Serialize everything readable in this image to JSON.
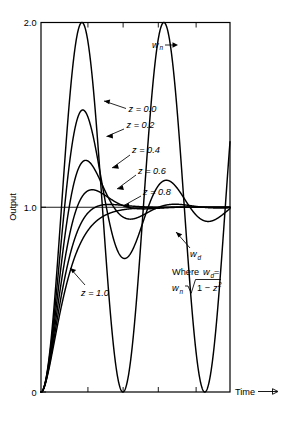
{
  "chart_data": {
    "type": "line",
    "title": "",
    "xlabel": "Time",
    "ylabel": "Output",
    "xlim": [
      0,
      14.5
    ],
    "ylim": [
      0,
      2.0
    ],
    "grid": false,
    "legend_position": "inline-annotations",
    "y_ticks": [
      "2.0",
      "1.0",
      "0"
    ],
    "y_tick_values": [
      2.0,
      1.0,
      0
    ],
    "x_ticks": [
      "",
      "",
      "",
      ""
    ],
    "x_tick_values": [
      3.6,
      6.3,
      9.0,
      11.9
    ],
    "series": [
      {
        "name": "z = 0.0",
        "zeta": 0.0,
        "label": "z = 0.0",
        "peak": 2.0
      },
      {
        "name": "z = 0.2",
        "zeta": 0.2,
        "label": "z = 0.2",
        "peak": 1.53
      },
      {
        "name": "z = 0.4",
        "zeta": 0.4,
        "label": "z = 0.4",
        "peak": 1.25
      },
      {
        "name": "z = 0.6",
        "zeta": 0.6,
        "label": "z = 0.6",
        "peak": 1.1
      },
      {
        "name": "z = 0.8",
        "zeta": 0.8,
        "label": "z = 0.8",
        "peak": 1.02
      },
      {
        "name": "z = 1.0",
        "zeta": 1.0,
        "label": "z = 1.0",
        "peak": 1.0
      }
    ],
    "annotations": [
      {
        "id": "wn",
        "text": "w",
        "sub": "n",
        "kind": "symbol-arrow"
      },
      {
        "id": "wd",
        "text": "w",
        "sub": "d",
        "kind": "symbol-arrow"
      },
      {
        "id": "formula",
        "line1_prefix": "Where ",
        "line1_sym": "w",
        "line1_sub": "d",
        "line1_eq": " =",
        "line2_sym": "w",
        "line2_sub": "n",
        "line2_radical": "1 − ",
        "line2_var": "z",
        "line2_exp": "2"
      }
    ]
  },
  "axes": {
    "y_label": "Output",
    "x_label": "Time",
    "x_arrow": "→",
    "y_tick_top": "2.0",
    "y_tick_mid": "1.0",
    "y_tick_bottom": "0"
  }
}
